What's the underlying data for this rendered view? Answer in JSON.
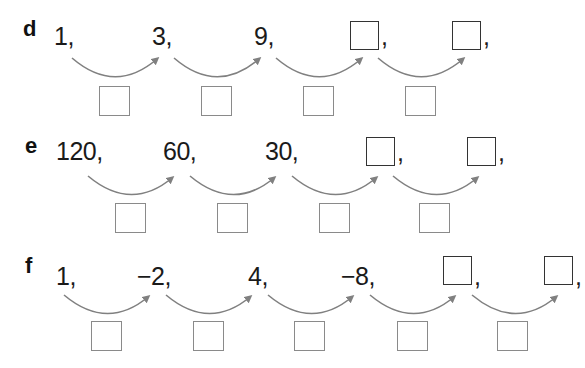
{
  "exercises": [
    {
      "label": "d",
      "terms": [
        "1,",
        "3,",
        "9,"
      ],
      "blank_terms": 2,
      "operation_boxes": 4
    },
    {
      "label": "e",
      "terms": [
        "120,",
        "60,",
        "30,"
      ],
      "blank_terms": 2,
      "operation_boxes": 4
    },
    {
      "label": "f",
      "terms": [
        "1,",
        "−2,",
        "4,",
        "−8,"
      ],
      "blank_terms": 2,
      "operation_boxes": 5
    }
  ],
  "blank_comma": ",",
  "colors": {
    "arrow": "#808080",
    "answer_box_border": "#333333",
    "operation_box_border": "#8a8a8a"
  }
}
